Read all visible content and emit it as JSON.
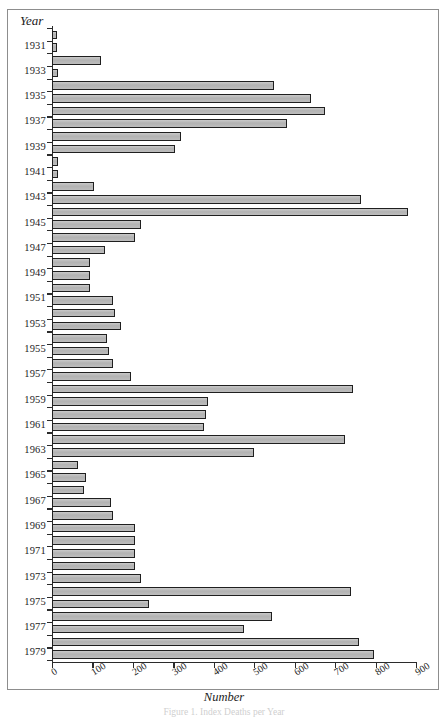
{
  "figure": {
    "caption": "Figure 1. Index Deaths per Year",
    "frame_color": "#8d8d8d",
    "bar_fill": "#b9b9b9",
    "bar_border": "#1f1f1f"
  },
  "chart_data": {
    "type": "bar",
    "orientation": "horizontal",
    "title": "",
    "xlabel": "Number",
    "ylabel": "Year",
    "xlim": [
      0,
      900
    ],
    "xticks": [
      0,
      100,
      200,
      300,
      400,
      500,
      600,
      700,
      800,
      900
    ],
    "xticklabels": [
      "0",
      "100",
      "200",
      "300",
      "400",
      "500",
      "600",
      "700",
      "800",
      "900"
    ],
    "grid": false,
    "legend": null,
    "ytick_labels_every": 2,
    "categories": [
      "1930",
      "1931",
      "1932",
      "1933",
      "1934",
      "1935",
      "1936",
      "1937",
      "1938",
      "1939",
      "1940",
      "1941",
      "1942",
      "1943",
      "1944",
      "1945",
      "1946",
      "1947",
      "1948",
      "1949",
      "1950",
      "1951",
      "1952",
      "1953",
      "1954",
      "1955",
      "1956",
      "1957",
      "1958",
      "1959",
      "1960",
      "1961",
      "1962",
      "1963",
      "1964",
      "1965",
      "1966",
      "1967",
      "1968",
      "1969",
      "1970",
      "1971",
      "1972",
      "1973",
      "1974",
      "1975",
      "1976",
      "1977",
      "1978",
      "1979"
    ],
    "values": [
      12,
      12,
      120,
      14,
      550,
      640,
      675,
      580,
      320,
      305,
      15,
      16,
      105,
      765,
      880,
      220,
      205,
      130,
      95,
      95,
      95,
      150,
      155,
      170,
      135,
      140,
      150,
      195,
      745,
      385,
      380,
      375,
      725,
      500,
      65,
      85,
      80,
      145,
      150,
      205,
      205,
      205,
      205,
      220,
      740,
      240,
      545,
      475,
      760,
      795
    ],
    "displayed_year_labels": [
      "1931",
      "1933",
      "1935",
      "1937",
      "1939",
      "1941",
      "1943",
      "1945",
      "1947",
      "1949",
      "1951",
      "1953",
      "1955",
      "1957",
      "1959",
      "1961",
      "1963",
      "1965",
      "1967",
      "1969",
      "1971",
      "1973",
      "1975",
      "1977",
      "1979"
    ]
  }
}
